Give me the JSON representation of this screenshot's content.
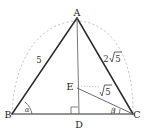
{
  "figure": {
    "kind": "geometry-diagram",
    "background_color": "#ffffff",
    "stroke_color": "#2b2b2b",
    "light_stroke_color": "#b9b9b9",
    "vertices": [
      {
        "name": "A",
        "label": "A",
        "x": 77,
        "y": 16
      },
      {
        "name": "B",
        "label": "B",
        "x": 12,
        "y": 114
      },
      {
        "name": "C",
        "label": "C",
        "x": 133,
        "y": 114
      },
      {
        "name": "D",
        "label": "D",
        "x": 79,
        "y": 122
      },
      {
        "name": "E",
        "label": "E",
        "x": 76,
        "y": 87
      }
    ],
    "side_labels": [
      {
        "name": "side-ab-length",
        "text": "5",
        "has_radical": false,
        "coefficient": "",
        "radicand": "5",
        "x": 39,
        "y": 60
      },
      {
        "name": "side-ac-length",
        "text": "2√5",
        "has_radical": true,
        "coefficient": "2",
        "radicand": "5",
        "x": 111,
        "y": 59
      },
      {
        "name": "segment-ec-length",
        "text": "√5",
        "has_radical": true,
        "coefficient": "",
        "radicand": "5",
        "x": 105,
        "y": 90
      }
    ],
    "angle_labels": [
      {
        "name": "angle-alpha",
        "text": "α",
        "x": 25,
        "y": 110
      },
      {
        "name": "angle-beta",
        "text": "β",
        "x": 109,
        "y": 111
      }
    ],
    "markers": [
      {
        "name": "right-angle-at-d",
        "type": "right-angle",
        "at": "D"
      },
      {
        "name": "angle-arc-at-b",
        "type": "arc",
        "at": "B"
      },
      {
        "name": "angle-arc-at-c",
        "type": "arc",
        "at": "C"
      }
    ],
    "segments": [
      {
        "name": "segment-ab",
        "from": "B",
        "to": "A",
        "style": "solid"
      },
      {
        "name": "segment-ac",
        "from": "A",
        "to": "C",
        "style": "solid"
      },
      {
        "name": "segment-bc",
        "from": "B",
        "to": "C",
        "style": "solid"
      },
      {
        "name": "segment-ad",
        "from": "A",
        "to": "D",
        "style": "solid-thin"
      },
      {
        "name": "segment-ec",
        "from": "E",
        "to": "C",
        "style": "solid-thin"
      },
      {
        "name": "arc-bac",
        "from": "B",
        "to": "C",
        "style": "dashed"
      }
    ]
  }
}
